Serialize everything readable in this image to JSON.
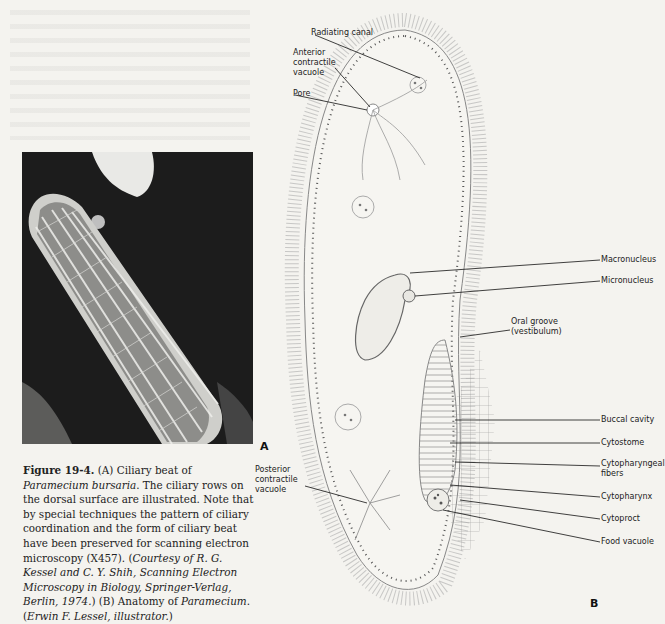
{
  "figure": {
    "panel_a_label": "A",
    "panel_b_label": "B",
    "photo_description": "Scanning electron micrograph of Paramecium bursaria showing ciliary rows",
    "caption": {
      "figure_number": "Figure 19-4.",
      "part1": " (A) Ciliary beat of ",
      "species_italic": "Paramecium bursaria",
      "part2": ". The ciliary rows on the dorsal surface are illustrated. Note that by special techniques the pattern of ciliary coordination and the form of ciliary beat have been preserved for scanning electron microscopy (X457). (",
      "credit_italic": "Courtesy of R. G. Kessel and C. Y. Shih, Scanning Electron Microscopy in Biology, Springer-Verlag, Berlin, 1974.",
      "part3": ") (B) Anatomy of ",
      "genus_italic": "Paramecium",
      "part4": ". (",
      "illustrator_italic": "Erwin F. Lessel, illustrator.",
      "part5": ")"
    },
    "labels": {
      "radiating_canal": "Radiating canal",
      "anterior_contractile_vacuole_1": "Anterior",
      "anterior_contractile_vacuole_2": "contractile",
      "anterior_contractile_vacuole_3": "vacuole",
      "pore": "Pore",
      "macronucleus": "Macronucleus",
      "micronucleus": "Micronucleus",
      "oral_groove_1": "Oral groove",
      "oral_groove_2": "(vestibulum)",
      "buccal_cavity": "Buccal cavity",
      "cytostome": "Cytostome",
      "cytopharyngeal_fibers_1": "Cytopharyngeal",
      "cytopharyngeal_fibers_2": "fibers",
      "cytopharynx": "Cytopharynx",
      "cytoproct": "Cytoproct",
      "food_vacuole": "Food vacuole",
      "posterior_contractile_vacuole_1": "Posterior",
      "posterior_contractile_vacuole_2": "contractile",
      "posterior_contractile_vacuole_3": "vacuole"
    }
  }
}
